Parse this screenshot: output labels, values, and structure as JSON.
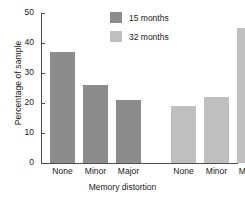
{
  "chart_data": {
    "type": "bar",
    "title": "",
    "xlabel": "Memory distortion",
    "ylabel": "Percentage of sample",
    "categories": [
      "None",
      "Minor",
      "Major"
    ],
    "series": [
      {
        "name": "15 months",
        "color": "#8c8c8c",
        "values": [
          37,
          26,
          21
        ]
      },
      {
        "name": "32 months",
        "color": "#bfbfbf",
        "values": [
          19,
          22,
          45
        ]
      }
    ],
    "ylim": [
      0,
      50
    ],
    "yticks": [
      0,
      10,
      20,
      30,
      40,
      50
    ],
    "ytick_labels": [
      "0",
      "10",
      "20",
      "30",
      "40",
      "50"
    ],
    "grid": false,
    "legend_position": "top-center",
    "axis_color": "#4d4d4d",
    "background": "#ffffff"
  },
  "legend": {
    "items": [
      {
        "label": "15 months",
        "color": "#8c8c8c"
      },
      {
        "label": "32 months",
        "color": "#bfbfbf"
      }
    ]
  },
  "xtick_labels": [
    "None",
    "Minor",
    "Major",
    "None",
    "Minor",
    "Major"
  ]
}
